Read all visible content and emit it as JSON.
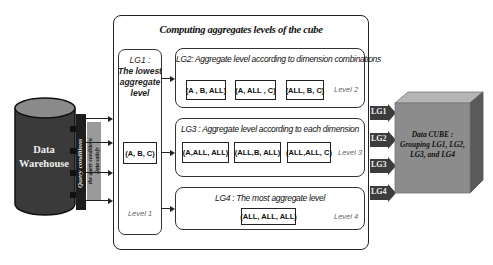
{
  "diagram": {
    "title": "Computing aggregates levels of the cube",
    "data_warehouse": {
      "label_line1": "Data",
      "label_line2": "Warehouse"
    },
    "query_strip": {
      "label": "Query conditions"
    },
    "filter_strip": {
      "label_line1": "Data satisfy",
      "label_line2": "the query conditions"
    },
    "lg1": {
      "title": "LG1 :",
      "desc_line1": "The lowest",
      "desc_line2": "aggregate",
      "desc_line3": "level",
      "cell": "(A, B, C)",
      "level": "Level 1"
    },
    "lg2": {
      "title": "LG2:  Aggregate level according  to dimension combinations",
      "cells": [
        "(A , B, ALL)",
        "(A,  ALL , C)",
        "(ALL, B, C)"
      ],
      "level": "Level 2"
    },
    "lg3": {
      "title": "LG3 : Aggregate level according  to each dimension",
      "cells": [
        "(A,ALL, ALL)",
        "(ALL,B, ALL)",
        "(ALL,ALL, C)"
      ],
      "level": "Level 3"
    },
    "lg4": {
      "title": "LG4 :  The most aggregate level",
      "cells": [
        "(ALL, ALL, ALL)"
      ],
      "level": "Level 4"
    },
    "output_arrows": [
      "LG1",
      "LG2",
      "LG3",
      "LG4"
    ],
    "cube": {
      "line1": "Data CUBE :",
      "line2": "Grouping  LG1, LG2,",
      "line3": "LG3, and LG4"
    },
    "colors": {
      "cylinder": "#3a3a3a",
      "cylinder_top": "#8a8a8a",
      "strip_dark": "#1e1e1e",
      "strip_gray": "#9a9a9a",
      "arrow_fill": "#3c3c3c",
      "cube_front": "#8c8c8c",
      "cube_top": "#b5b5b5",
      "cube_side": "#5a5a5a"
    }
  }
}
